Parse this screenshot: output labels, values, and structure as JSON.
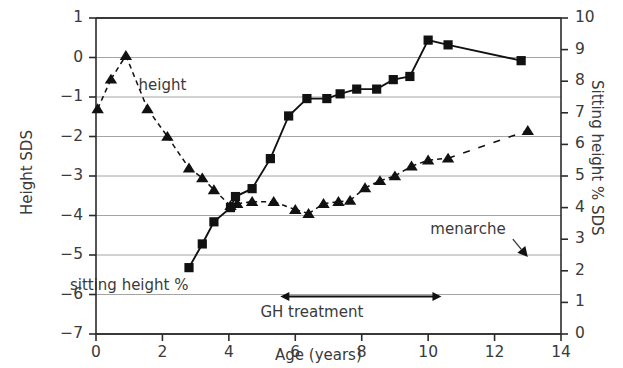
{
  "chart_data": {
    "type": "line",
    "title": "",
    "xlabel": "Age (years)",
    "ylabel": "Height SDS",
    "y2label": "Sitting height % SDS",
    "xlim": [
      0,
      14
    ],
    "ylim": [
      -7,
      1
    ],
    "y2lim": [
      0,
      10
    ],
    "xticks": [
      "0",
      "2",
      "4",
      "6",
      "8",
      "10",
      "12",
      "14"
    ],
    "xtick_values": [
      0,
      2,
      4,
      6,
      8,
      10,
      12,
      14
    ],
    "yticks": [
      "1",
      "0",
      "−1",
      "−2",
      "−3",
      "−4",
      "−5",
      "−6",
      "−7"
    ],
    "ytick_values": [
      1,
      0,
      -1,
      -2,
      -3,
      -4,
      -5,
      -6,
      -7
    ],
    "y2ticks": [
      "10",
      "9",
      "8",
      "7",
      "6",
      "5",
      "4",
      "3",
      "2",
      "1",
      "0"
    ],
    "y2tick_values": [
      10,
      9,
      8,
      7,
      6,
      5,
      4,
      3,
      2,
      1,
      0
    ],
    "grid": true,
    "grid_axis": "y",
    "legend_position": "inline-annotations",
    "series": [
      {
        "name": "height",
        "axis": "left",
        "marker": "triangle",
        "linestyle": "dashed",
        "color": "#111111",
        "points": [
          [
            0.05,
            -1.3
          ],
          [
            0.45,
            -0.55
          ],
          [
            0.9,
            0.05
          ],
          [
            1.55,
            -1.3
          ],
          [
            2.15,
            -2.0
          ],
          [
            2.8,
            -2.8
          ],
          [
            3.2,
            -3.05
          ],
          [
            3.55,
            -3.35
          ],
          [
            4.05,
            -3.75
          ],
          [
            4.25,
            -3.7
          ],
          [
            4.7,
            -3.65
          ],
          [
            5.35,
            -3.65
          ],
          [
            6.0,
            -3.85
          ],
          [
            6.4,
            -3.95
          ],
          [
            6.85,
            -3.7
          ],
          [
            7.3,
            -3.65
          ],
          [
            7.65,
            -3.62
          ],
          [
            8.1,
            -3.3
          ],
          [
            8.55,
            -3.12
          ],
          [
            9.0,
            -3.0
          ],
          [
            9.5,
            -2.75
          ],
          [
            10.0,
            -2.6
          ],
          [
            10.6,
            -2.55
          ],
          [
            13.0,
            -1.85
          ]
        ]
      },
      {
        "name": "sitting height %",
        "axis": "right",
        "marker": "square",
        "linestyle": "solid",
        "color": "#111111",
        "points": [
          [
            2.8,
            2.1
          ],
          [
            3.2,
            2.85
          ],
          [
            3.55,
            3.55
          ],
          [
            4.05,
            4.0
          ],
          [
            4.2,
            4.35
          ],
          [
            4.7,
            4.6
          ],
          [
            5.25,
            5.55
          ],
          [
            5.8,
            6.9
          ],
          [
            6.35,
            7.45
          ],
          [
            6.95,
            7.45
          ],
          [
            7.35,
            7.6
          ],
          [
            7.85,
            7.75
          ],
          [
            8.45,
            7.75
          ],
          [
            8.95,
            8.05
          ],
          [
            9.45,
            8.15
          ],
          [
            10.0,
            9.3
          ],
          [
            10.6,
            9.15
          ],
          [
            12.8,
            8.65
          ]
        ]
      }
    ],
    "annotations": [
      {
        "name": "height-label",
        "text": "height",
        "x": 2.0,
        "y": -0.7,
        "axis": "left"
      },
      {
        "name": "sitting-height-label",
        "text": "sitting height %",
        "x": 1.0,
        "y": -5.75,
        "axis": "left"
      },
      {
        "name": "menarche-label",
        "text": "menarche",
        "x": 11.2,
        "y": -4.35,
        "axis": "left"
      },
      {
        "name": "gh-treatment-label",
        "text": "GH treatment",
        "x": 6.5,
        "y": -6.45,
        "axis": "left"
      }
    ],
    "arrows": [
      {
        "name": "gh-treatment-span-arrow",
        "from_x": 5.55,
        "to_x": 10.4,
        "y": -6.05,
        "double_headed": true
      },
      {
        "name": "menarche-pointer-arrow",
        "from_x": 12.55,
        "from_y": -4.6,
        "to_x": 13.0,
        "to_y": -5.05,
        "double_headed": false
      }
    ]
  },
  "axes": {
    "left_title": "Height SDS",
    "right_title": "Sitting height % SDS",
    "bottom_title": "Age (years)"
  }
}
